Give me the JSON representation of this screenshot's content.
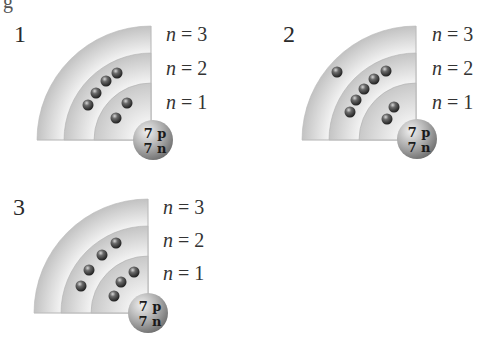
{
  "figure": {
    "cutoff_glyph": "g",
    "panels": [
      {
        "id": "1",
        "label": "1",
        "nucleus": {
          "protons": "7 p",
          "neutrons": "7 n"
        },
        "shells": [
          {
            "label_n": "n",
            "label_eq": " = 3",
            "electrons": 0
          },
          {
            "label_n": "n",
            "label_eq": " = 2",
            "electrons": 4
          },
          {
            "label_n": "n",
            "label_eq": " = 1",
            "electrons": 2
          }
        ]
      },
      {
        "id": "2",
        "label": "2",
        "nucleus": {
          "protons": "7 p",
          "neutrons": "7 n"
        },
        "shells": [
          {
            "label_n": "n",
            "label_eq": " = 3",
            "electrons": 1
          },
          {
            "label_n": "n",
            "label_eq": " = 2",
            "electrons": 5
          },
          {
            "label_n": "n",
            "label_eq": " = 1",
            "electrons": 2
          }
        ]
      },
      {
        "id": "3",
        "label": "3",
        "nucleus": {
          "protons": "7 p",
          "neutrons": "7 n"
        },
        "shells": [
          {
            "label_n": "n",
            "label_eq": " = 3",
            "electrons": 0
          },
          {
            "label_n": "n",
            "label_eq": " = 2",
            "electrons": 4
          },
          {
            "label_n": "n",
            "label_eq": " = 1",
            "electrons": 3
          }
        ]
      }
    ],
    "colors": {
      "shell_light": "#f2f2f2",
      "shell_dark": "#c4c4c4",
      "electron": "#2b2b2b",
      "nucleus": "#a8a8a8",
      "text": "#333333"
    }
  }
}
